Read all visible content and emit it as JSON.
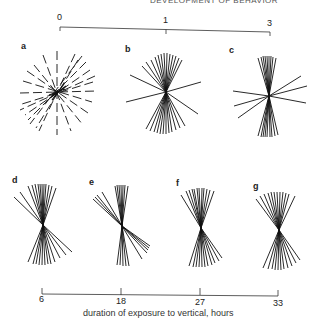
{
  "header": {
    "text": "DEVELOPMENT OF BEHAVIOR"
  },
  "top_axis": {
    "ticks": [
      {
        "label": "0",
        "x": 60
      },
      {
        "label": "1",
        "x": 166
      },
      {
        "label": "3",
        "x": 270
      }
    ]
  },
  "bottom_axis": {
    "ticks": [
      {
        "label": "6",
        "x": 42
      },
      {
        "label": "18",
        "x": 121
      },
      {
        "label": "27",
        "x": 200
      },
      {
        "label": "33",
        "x": 278
      }
    ],
    "caption": "duration of exposure to vertical, hours"
  },
  "panels": [
    {
      "label": "a",
      "description": "random orientation, short dashed lines in all directions"
    },
    {
      "label": "b",
      "description": "predominantly vertical lines with a few oblique"
    },
    {
      "label": "c",
      "description": "strongly vertical with few horizontal outliers"
    },
    {
      "label": "d",
      "description": "vertical-biased fan"
    },
    {
      "label": "e",
      "description": "vertical-biased fan, tilted cluster"
    },
    {
      "label": "f",
      "description": "vertical-biased fan"
    },
    {
      "label": "g",
      "description": "vertical-biased fan"
    }
  ]
}
